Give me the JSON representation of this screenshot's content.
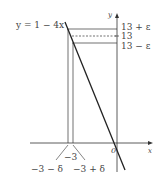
{
  "diagram": {
    "line_label": "y = 1 − 4x",
    "axes": {
      "x_label": "x",
      "y_label": "y",
      "origin_label": "0"
    },
    "y_labels": {
      "upper": "13 + ε",
      "middle": "13",
      "lower": "13 − ε"
    },
    "x_labels": {
      "center": "−3",
      "left": "−3 − δ",
      "right": "−3 + δ"
    },
    "colors": {
      "stroke": "#333333",
      "text": "#444444"
    }
  }
}
